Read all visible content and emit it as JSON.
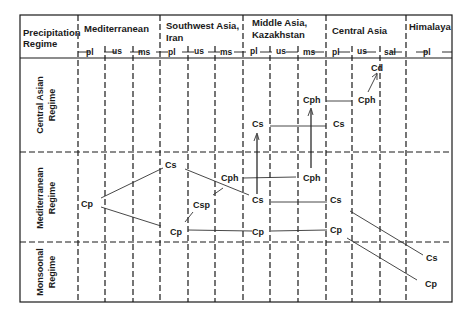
{
  "header": {
    "corner_line1": "Precipitation",
    "corner_line2": "Regime",
    "regions": [
      {
        "line1": "Mediterranean",
        "line2": ""
      },
      {
        "line1": "Southwest Asia,",
        "line2": "Iran"
      },
      {
        "line1": "Middle Asia,",
        "line2": "Kazakhstan"
      },
      {
        "line1": "Central Asia",
        "line2": ""
      },
      {
        "line1": "Himalaya",
        "line2": ""
      }
    ],
    "subcolumns": [
      "pl",
      "us",
      "ms",
      "pl",
      "us",
      "ms",
      "pl",
      "us",
      "ms",
      "pl",
      "us",
      "sal",
      "pl"
    ]
  },
  "regimes": [
    {
      "line1": "Central Asian",
      "line2": "Regime"
    },
    {
      "line1": "Mediterranean",
      "line2": "Regime"
    },
    {
      "line1": "Monsoonal",
      "line2": "Regime"
    }
  ],
  "nodes": [
    {
      "id": "n1",
      "label": "Cd"
    },
    {
      "id": "n2",
      "label": "Cph"
    },
    {
      "id": "n3",
      "label": "Cph"
    },
    {
      "id": "n4",
      "label": "Cs"
    },
    {
      "id": "n5",
      "label": "Cs"
    },
    {
      "id": "n6",
      "label": "Cs"
    },
    {
      "id": "n7",
      "label": "Cph"
    },
    {
      "id": "n8",
      "label": "Cph"
    },
    {
      "id": "n9",
      "label": "Cp"
    },
    {
      "id": "n10",
      "label": "Csp"
    },
    {
      "id": "n11",
      "label": "Cs"
    },
    {
      "id": "n12",
      "label": "Cs"
    },
    {
      "id": "n13",
      "label": "Cp"
    },
    {
      "id": "n14",
      "label": "Cp"
    },
    {
      "id": "n15",
      "label": "Cp"
    },
    {
      "id": "n16",
      "label": "Cs"
    },
    {
      "id": "n17",
      "label": "Cp"
    }
  ]
}
